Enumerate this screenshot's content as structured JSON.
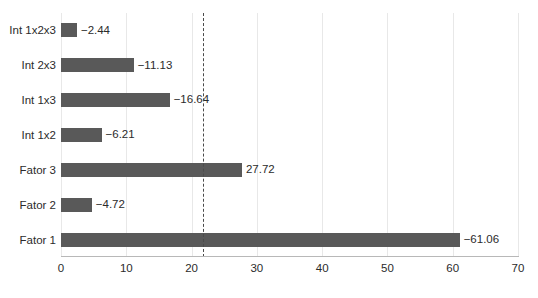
{
  "chart_data": {
    "type": "bar",
    "orientation": "horizontal",
    "title": "",
    "subtitle": "",
    "xlabel": "",
    "ylabel": "",
    "categories": [
      "Int 1x2x3",
      "Int 2x3",
      "Int 1x3",
      "Int 1x2",
      "Fator 3",
      "Fator 2",
      "Fator 1"
    ],
    "values": [
      2.44,
      11.13,
      16.64,
      6.21,
      27.72,
      4.72,
      61.06
    ],
    "data_labels": [
      "−2.44",
      "−11.13",
      "−16.64",
      "−6.21",
      "27.72",
      "−4.72",
      "−61.06"
    ],
    "signed_values": [
      -2.44,
      -11.13,
      -16.64,
      -6.21,
      27.72,
      -4.72,
      -61.06
    ],
    "xlim": [
      0,
      70
    ],
    "xticks": [
      0,
      10,
      20,
      30,
      40,
      50,
      60,
      70
    ],
    "xtick_labels": [
      "0",
      "10",
      "20",
      "30",
      "40",
      "50",
      "60",
      "70"
    ],
    "grid": true,
    "grid_axis": "x",
    "legend": null,
    "bar_color": "#595959",
    "gridline_color": "#E8E8E8",
    "reference_line": {
      "value": 21.8,
      "style": "dashed",
      "color": "#4A4A4A",
      "label": ""
    }
  },
  "chart": {
    "bars": [
      {
        "category": "Int 1x2x3",
        "label": "−2.44",
        "magnitude": 2.44
      },
      {
        "category": "Int 2x3",
        "label": "−11.13",
        "magnitude": 11.13
      },
      {
        "category": "Int 1x3",
        "label": "−16.64",
        "magnitude": 16.64
      },
      {
        "category": "Int 1x2",
        "label": "−6.21",
        "magnitude": 6.21
      },
      {
        "category": "Fator 3",
        "label": "27.72",
        "magnitude": 27.72
      },
      {
        "category": "Fator 2",
        "label": "−4.72",
        "magnitude": 4.72
      },
      {
        "category": "Fator 1",
        "label": "−61.06",
        "magnitude": 61.06
      }
    ]
  }
}
